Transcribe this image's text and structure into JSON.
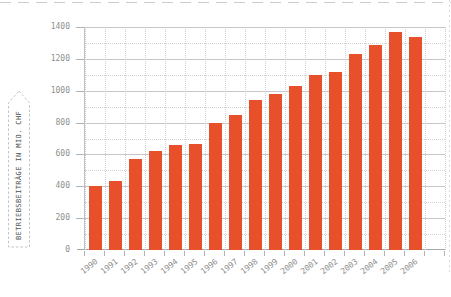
{
  "page": {
    "background": "#ffffff",
    "border_dash_color": "#cccccc"
  },
  "y_axis_label": {
    "text": "BETRIEBSBEITRÄGE IN MIO. CHF"
  },
  "chart_data": {
    "type": "bar",
    "title": "",
    "xlabel": "",
    "ylabel": "BETRIEBSBEITRÄGE IN MIO. CHF",
    "categories": [
      "1990",
      "1991",
      "1992",
      "1993",
      "1994",
      "1995",
      "1996",
      "1997",
      "1998",
      "1999",
      "2000",
      "2001",
      "2002",
      "2003",
      "2004",
      "2005",
      "2006"
    ],
    "values": [
      400,
      435,
      570,
      620,
      660,
      665,
      800,
      845,
      940,
      980,
      1030,
      1100,
      1115,
      1230,
      1290,
      1370,
      1335
    ],
    "ylim": [
      0,
      1400
    ],
    "yticks": [
      0,
      200,
      400,
      600,
      800,
      1000,
      1200,
      1400
    ],
    "minor_ytick_step": 100,
    "grid": true,
    "legend": "none",
    "bar_color": "#e8502b",
    "axis_label_color": "#8f8f8f",
    "major_grid_color": "#c6c6c6",
    "minor_grid_color": "#d4d4d4",
    "vertical_grid_color": "#c9d0d9"
  }
}
